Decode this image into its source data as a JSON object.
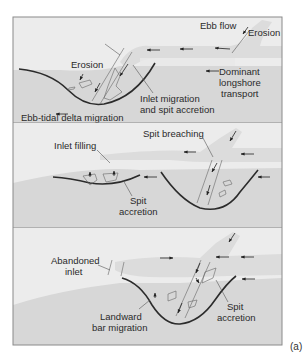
{
  "figure": {
    "label": "(a)",
    "colors": {
      "frame": "#8a8a8a",
      "land_background": "#ececec",
      "water_background": "#d7d7d7",
      "flow_band": "#dedede",
      "shoreline": "#2b2b2b",
      "annotation_line": "#555555",
      "text": "#2a2a2a"
    },
    "panels": [
      {
        "id": "panel-1",
        "labels": {
          "ebb_flow": "Ebb flow",
          "erosion_top": "Erosion",
          "erosion_left": "Erosion",
          "dominant_l1": "Dominant",
          "dominant_l2": "longshore",
          "dominant_l3": "transport",
          "inlet_migration_l1": "Inlet migration",
          "inlet_migration_l2": "and spit accretion",
          "delta_migration": "Ebb-tidal delta migration"
        }
      },
      {
        "id": "panel-2",
        "labels": {
          "inlet_filling": "Inlet filling",
          "spit_breaching": "Spit breaching",
          "spit_accretion_l1": "Spit",
          "spit_accretion_l2": "accretion"
        }
      },
      {
        "id": "panel-3",
        "labels": {
          "abandoned_l1": "Abandoned",
          "abandoned_l2": "inlet",
          "landward_l1": "Landward",
          "landward_l2": "bar migration",
          "spit_accretion_l1": "Spit",
          "spit_accretion_l2": "accretion"
        }
      }
    ]
  }
}
